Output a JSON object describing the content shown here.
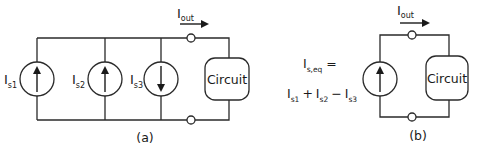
{
  "figure_a": {
    "caption": "(a)",
    "sources": [
      {
        "label_main": "I",
        "label_sub": "s1",
        "direction": "up"
      },
      {
        "label_main": "I",
        "label_sub": "s2",
        "direction": "up"
      },
      {
        "label_main": "I",
        "label_sub": "s3",
        "direction": "down"
      }
    ],
    "output_current": {
      "label_main": "I",
      "label_sub": "out"
    },
    "load_label": "Circuit"
  },
  "equation": {
    "lhs_main": "I",
    "lhs_sub": "s,eq",
    "equals": "=",
    "terms": [
      {
        "main": "I",
        "sub": "s1"
      },
      {
        "op": "+"
      },
      {
        "main": "I",
        "sub": "s2"
      },
      {
        "op": "−"
      },
      {
        "main": "I",
        "sub": "s3"
      }
    ]
  },
  "figure_b": {
    "caption": "(b)",
    "source": {
      "direction": "up"
    },
    "output_current": {
      "label_main": "I",
      "label_sub": "out"
    },
    "load_label": "Circuit"
  },
  "colors": {
    "line": "#2a2a2a",
    "text": "#1a1a1a",
    "background": "#ffffff"
  }
}
